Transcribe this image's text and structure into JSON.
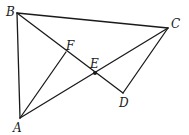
{
  "diagram": {
    "type": "geometry-figure",
    "points": [
      {
        "name": "A",
        "label": "A"
      },
      {
        "name": "B",
        "label": "B"
      },
      {
        "name": "C",
        "label": "C"
      },
      {
        "name": "D",
        "label": "D"
      },
      {
        "name": "E",
        "label": "E"
      },
      {
        "name": "F",
        "label": "F"
      }
    ],
    "segments": [
      [
        "A",
        "B"
      ],
      [
        "B",
        "C"
      ],
      [
        "A",
        "C"
      ],
      [
        "B",
        "D"
      ],
      [
        "C",
        "D"
      ],
      [
        "A",
        "F"
      ]
    ],
    "marked_points": [
      "E"
    ],
    "colors": {
      "stroke": "#1a1a1a",
      "background": "#ffffff"
    }
  }
}
